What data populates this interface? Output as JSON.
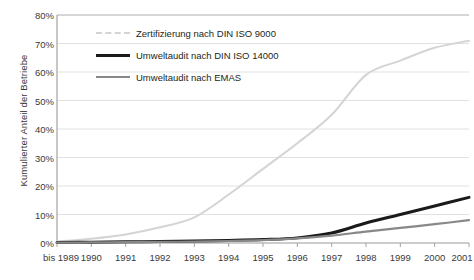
{
  "chart_data": {
    "type": "line",
    "title": "",
    "xlabel": "",
    "ylabel": "Kumulierter Anteil der Betriebe",
    "categories": [
      "bis 1989",
      "1990",
      "1991",
      "1992",
      "1993",
      "1994",
      "1995",
      "1996",
      "1997",
      "1998",
      "1999",
      "2000",
      "2001"
    ],
    "ylim": [
      0,
      80
    ],
    "ytick_labels": [
      "0%",
      "10%",
      "20%",
      "30%",
      "40%",
      "50%",
      "60%",
      "70%",
      "80%"
    ],
    "ytick_values": [
      0,
      10,
      20,
      30,
      40,
      50,
      60,
      70,
      80
    ],
    "grid": true,
    "legend_position": "upper-left-inside",
    "series": [
      {
        "name": "Zertifizierung nach DIN ISO 9000",
        "color": "#d4d4d4",
        "width": 2.0,
        "values": [
          0.5,
          1.5,
          3.0,
          5.5,
          9.0,
          17.0,
          26.0,
          35.0,
          45.0,
          59.0,
          64.0,
          68.5,
          71.0
        ]
      },
      {
        "name": "Umweltaudit nach DIN ISO 14000",
        "color": "#1a1a1a",
        "width": 3.0,
        "values": [
          0.2,
          0.3,
          0.4,
          0.5,
          0.7,
          0.9,
          1.2,
          1.8,
          3.5,
          7.0,
          10.0,
          13.0,
          16.0
        ]
      },
      {
        "name": "Umweltaudit nach EMAS",
        "color": "#888888",
        "width": 2.2,
        "values": [
          0.1,
          0.2,
          0.3,
          0.4,
          0.5,
          0.7,
          1.0,
          1.6,
          2.6,
          4.0,
          5.3,
          6.6,
          8.0
        ]
      }
    ]
  },
  "legend": {
    "items": [
      {
        "label": "Zertifizierung nach DIN ISO 9000"
      },
      {
        "label": "Umweltaudit nach DIN ISO 14000"
      },
      {
        "label": "Umweltaudit nach EMAS"
      }
    ]
  },
  "colors": {
    "iso9000": "#d4d4d4",
    "iso14000": "#1a1a1a",
    "emas": "#888888",
    "grid": "#d9d9d9",
    "axis": "#9a9a9a",
    "text": "#3a3a3a"
  }
}
